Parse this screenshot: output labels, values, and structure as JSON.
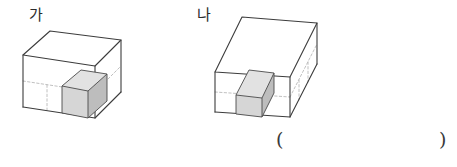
{
  "page": {
    "background_color": "#ffffff",
    "width": 457,
    "height": 167
  },
  "figures": [
    {
      "id": "figure-ga",
      "label": "가",
      "shape": "rectangular-prism",
      "unit_cube": {
        "present": true,
        "position": "front-right-bottom corner",
        "top_face_color": "#e2e2e2",
        "front_face_color": "#d6d6d6",
        "right_face_color": "#bdbdbd"
      },
      "hidden_edges_style": "dashed",
      "edge_color": "#3c3c3c",
      "face_color": "#ffffff",
      "proportions": "wide and shallow box; roughly 3 units wide by 3 units deep by 2 units tall"
    },
    {
      "id": "figure-na",
      "label": "나",
      "shape": "rectangular-prism",
      "unit_cube": {
        "present": true,
        "position": "front-left-bottom corner",
        "top_face_color": "#e2e2e2",
        "front_face_color": "#d6d6d6",
        "right_face_color": "#bdbdbd"
      },
      "hidden_edges_style": "dashed",
      "edge_color": "#3c3c3c",
      "face_color": "#ffffff",
      "proportions": "long elongated box extending back-right; roughly 2 units wide by 6 units deep by 2 units tall"
    }
  ],
  "answer_blank": {
    "open_paren": "(",
    "close_paren": ")",
    "value": ""
  }
}
